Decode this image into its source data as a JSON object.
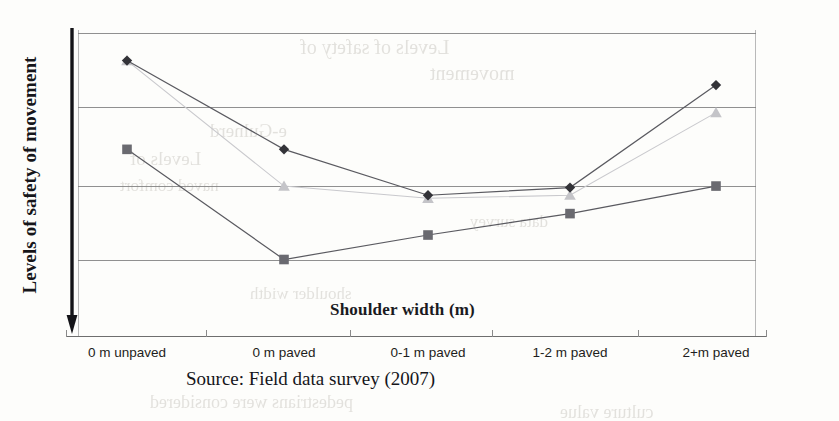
{
  "figure": {
    "y_axis_label": "Levels of safety of movement",
    "x_axis_title": "Shoulder width (m)",
    "source_note": "Source: Field data survey (2007)",
    "arrow_icon": "down-arrow-icon"
  },
  "ghost_text": [
    {
      "text": "Levels of safety of",
      "x": 300,
      "y": 36,
      "size": 20
    },
    {
      "text": "movement",
      "x": 430,
      "y": 62,
      "size": 20
    },
    {
      "text": "e-Gulnerd",
      "x": 210,
      "y": 120,
      "size": 19
    },
    {
      "text": "Levels of",
      "x": 130,
      "y": 148,
      "size": 19
    },
    {
      "text": "naved   comfort",
      "x": 120,
      "y": 176,
      "size": 17
    },
    {
      "text": "data survey",
      "x": 470,
      "y": 212,
      "size": 17
    },
    {
      "text": "shoulder width",
      "x": 250,
      "y": 284,
      "size": 17
    },
    {
      "text": "pedestrians were considered",
      "x": 150,
      "y": 392,
      "size": 18
    },
    {
      "text": "culture value",
      "x": 560,
      "y": 402,
      "size": 18
    }
  ],
  "chart_data": {
    "type": "line",
    "title": "",
    "xlabel": "Shoulder width (m)",
    "ylabel": "Levels of safety of movement",
    "categories": [
      "0 m unpaved",
      "0 m paved",
      "0-1 m paved",
      "1-2 m paved",
      "2+m paved"
    ],
    "ylim": [
      0,
      10
    ],
    "y_axis_direction": "downward-arrow-no-ticks",
    "y_tick_labels": [],
    "grid": "horizontal",
    "gridline_y_values": [
      9.9,
      7.5,
      4.9,
      2.5,
      0
    ],
    "legend": "none",
    "series": [
      {
        "name": "Series 1",
        "marker": "diamond",
        "color": "#333338",
        "values": [
          9.0,
          6.1,
          4.6,
          4.85,
          8.2
        ]
      },
      {
        "name": "Series 2",
        "marker": "square",
        "color": "#6a6a70",
        "values": [
          6.1,
          2.5,
          3.3,
          4.0,
          4.9
        ]
      },
      {
        "name": "Series 3",
        "marker": "triangle",
        "color": "#c4c4c8",
        "values": [
          9.0,
          4.9,
          4.5,
          4.6,
          7.3
        ]
      }
    ]
  }
}
